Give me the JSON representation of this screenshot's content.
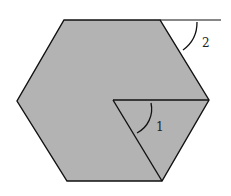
{
  "diagram": {
    "colors": {
      "fill": "#b3b3b3",
      "stroke": "#111111",
      "background": "#ffffff"
    },
    "hexagon": {
      "vertices": [
        [
          64,
          20
        ],
        [
          160,
          20
        ],
        [
          209,
          100
        ],
        [
          162,
          181
        ],
        [
          67,
          181
        ],
        [
          17,
          101
        ]
      ]
    },
    "extension_line": {
      "from": [
        160,
        20
      ],
      "to": [
        221,
        20
      ]
    },
    "inner_lines": [
      {
        "from": [
          113,
          100
        ],
        "to": [
          209,
          100
        ]
      },
      {
        "from": [
          113,
          100
        ],
        "to": [
          162,
          181
        ]
      }
    ],
    "angles": [
      {
        "id": "1",
        "label": "1",
        "label_pos": [
          159,
          130
        ]
      },
      {
        "id": "2",
        "label": "2",
        "label_pos": [
          202,
          47
        ]
      }
    ]
  }
}
